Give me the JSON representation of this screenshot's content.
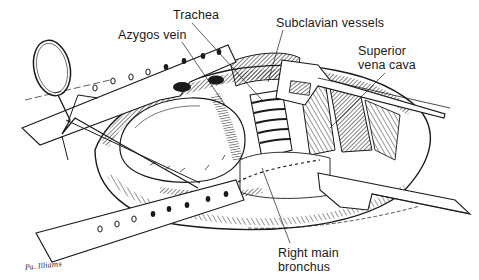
{
  "figure": {
    "style": "black-and-white pen-and-ink medical illustration",
    "colors": {
      "ink": "#1a1a1a",
      "background": "#ffffff",
      "shade": "#555555"
    }
  },
  "labels": {
    "trachea": "Trachea",
    "azygos_vein": "Azygos vein",
    "subclavian_vessels": "Subclavian vessels",
    "superior_vena_cava_line1": "Superior",
    "superior_vena_cava_line2": "vena cava",
    "right_main_bronchus_line1": "Right main",
    "right_main_bronchus_line2": "bronchus"
  },
  "signature": "Pa. Illiams"
}
